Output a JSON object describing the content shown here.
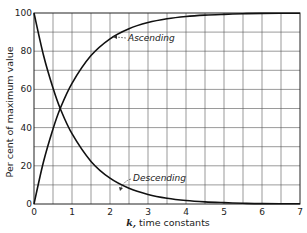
{
  "chart_data": {
    "type": "line",
    "title": "",
    "xlabel_var": "k,",
    "xlabel_rest": " time constants",
    "xlabel": "k, time constants",
    "ylabel": "Per cent of maximum value",
    "xlim": [
      0,
      7
    ],
    "ylim": [
      0,
      100
    ],
    "xticks": [
      "0",
      "1",
      "2",
      "3",
      "4",
      "5",
      "6",
      "7"
    ],
    "yticks": [
      "0",
      "20",
      "40",
      "60",
      "80",
      "100"
    ],
    "grid": true,
    "grid_x_step": 0.5,
    "grid_y_step": 10,
    "legend": null,
    "x": [
      0,
      0.25,
      0.5,
      0.69,
      1,
      1.5,
      2,
      2.5,
      3,
      3.5,
      4,
      4.5,
      5,
      5.5,
      6,
      7
    ],
    "series": [
      {
        "name": "Ascending",
        "values": [
          0,
          22.1,
          39.3,
          50,
          63.2,
          77.7,
          86.5,
          91.8,
          95.0,
          97.0,
          98.2,
          98.9,
          99.3,
          99.6,
          99.8,
          99.9
        ]
      },
      {
        "name": "Descending",
        "values": [
          100,
          77.9,
          60.7,
          50,
          36.8,
          22.3,
          13.5,
          8.2,
          5.0,
          3.0,
          1.8,
          1.1,
          0.7,
          0.4,
          0.2,
          0.1
        ]
      }
    ],
    "annotations": [
      {
        "text": "Ascending",
        "series": "Ascending",
        "arrow_to_x": 2.1
      },
      {
        "text": "Descending",
        "series": "Descending",
        "arrow_to_x": 2.3
      }
    ]
  }
}
